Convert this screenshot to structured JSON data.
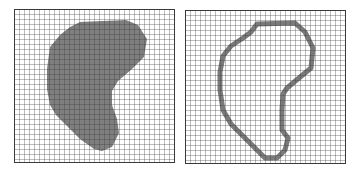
{
  "figure": {
    "panels": [
      {
        "id": "filled",
        "label": "filled-region",
        "grid": {
          "cols": 32,
          "rows": 31,
          "cell_px": 5
        },
        "fill_color": "#7f7f7f",
        "grid_color": "#3a3a3a",
        "background": "#ffffff"
      },
      {
        "id": "outline",
        "label": "boundary-outline",
        "grid": {
          "cols": 32,
          "rows": 31,
          "cell_px": 5
        },
        "stroke_color": "#7a7a7a",
        "grid_color": "#3a3a3a",
        "background": "#ffffff"
      }
    ]
  }
}
